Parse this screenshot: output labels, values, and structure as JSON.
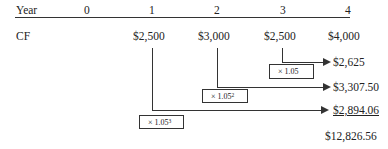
{
  "header": {
    "label": "Year",
    "years": [
      "0",
      "1",
      "2",
      "3",
      "4"
    ]
  },
  "cash_flow": {
    "label": "CF",
    "values": [
      "$2,500",
      "$3,000",
      "$2,500",
      "$4,000"
    ]
  },
  "compounded": [
    {
      "from_year": "3",
      "factor": "× 1.05",
      "exponent": "",
      "result": "$2,625"
    },
    {
      "from_year": "2",
      "factor": "× 1.05",
      "exponent": "2",
      "result": "$3,307.50"
    },
    {
      "from_year": "1",
      "factor": "× 1.05",
      "exponent": "3",
      "result": "$2,894.06"
    }
  ],
  "total": "$12,826.56"
}
